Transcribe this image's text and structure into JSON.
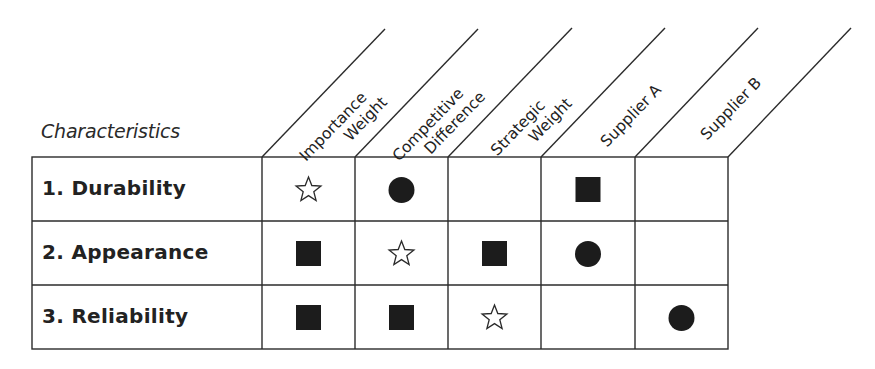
{
  "matrix": {
    "row_header_title": "Characteristics",
    "columns": [
      {
        "line1": "Importance",
        "line2": "Weight"
      },
      {
        "line1": "Competitive",
        "line2": "Difference"
      },
      {
        "line1": "Strategic",
        "line2": "Weight"
      },
      {
        "line1": "Supplier A",
        "line2": ""
      },
      {
        "line1": "Supplier B",
        "line2": ""
      }
    ],
    "rows": [
      {
        "label": "1. Durability",
        "cells": [
          "star-outline",
          "circle-filled",
          "",
          "square-filled",
          ""
        ]
      },
      {
        "label": "2. Appearance",
        "cells": [
          "square-filled",
          "star-outline",
          "square-filled",
          "circle-filled",
          ""
        ]
      },
      {
        "label": "3. Reliability",
        "cells": [
          "square-filled",
          "square-filled",
          "star-outline",
          "",
          "circle-filled"
        ]
      }
    ],
    "symbol_legend": {
      "star-outline": "open star",
      "circle-filled": "filled circle",
      "square-filled": "filled square"
    },
    "colors": {
      "line": "#2b2b2b",
      "symbol_fill": "#1c1c1c",
      "background": "#ffffff"
    }
  }
}
